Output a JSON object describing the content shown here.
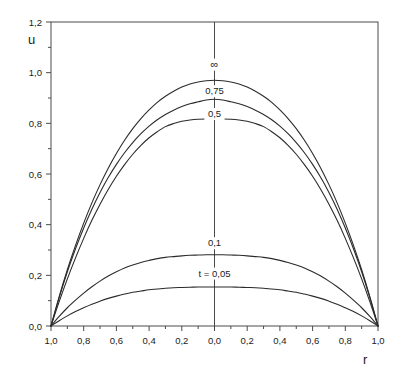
{
  "figure": {
    "axis_label_y": "u",
    "axis_label_x": "r",
    "background": "#ffffff",
    "line_color": "#2b2b2b",
    "axis_color": "#4a4a4a"
  },
  "chart_data": {
    "type": "line",
    "title": "",
    "subtitle": "",
    "xlabel": "r",
    "ylabel": "u",
    "xlim": [
      -1.0,
      1.0
    ],
    "ylim": [
      0.0,
      1.2
    ],
    "grid": false,
    "legend": "inline-curve-labels",
    "x_tick_labels": [
      "1,0",
      "0,8",
      "0,6",
      "0,4",
      "0,2",
      "0,0",
      "0,2",
      "0,4",
      "0,6",
      "0,8",
      "1,0"
    ],
    "x_tick_values": [
      -1.0,
      -0.8,
      -0.6,
      -0.4,
      -0.2,
      0.0,
      0.2,
      0.4,
      0.6,
      0.8,
      1.0
    ],
    "y_tick_labels": [
      "0,0",
      "0,2",
      "0,4",
      "0,6",
      "0,8",
      "1,0",
      "1,2"
    ],
    "y_tick_values": [
      0.0,
      0.2,
      0.4,
      0.6,
      0.8,
      1.0,
      1.2
    ],
    "y_minor_tick_values": [
      0.1,
      0.3,
      0.5,
      0.7,
      0.9,
      1.1
    ],
    "x_minor_tick_values": [
      -0.9,
      -0.7,
      -0.5,
      -0.3,
      -0.1,
      0.1,
      0.3,
      0.5,
      0.7,
      0.9
    ],
    "annotations": [
      {
        "text": "∞",
        "x": 0.0,
        "y": 1.02
      },
      {
        "text": "0,75",
        "x": 0.0,
        "y": 0.915
      },
      {
        "text": "0,5",
        "x": 0.0,
        "y": 0.825
      },
      {
        "text": "0,1",
        "x": 0.0,
        "y": 0.315
      },
      {
        "text": "t = 0,05",
        "x": 0.0,
        "y": 0.195
      }
    ],
    "series": [
      {
        "name": "∞",
        "label": "∞",
        "t": "inf",
        "peak_value": 0.97,
        "x": [
          -1.0,
          -0.95,
          -0.9,
          -0.85,
          -0.8,
          -0.75,
          -0.7,
          -0.65,
          -0.6,
          -0.55,
          -0.5,
          -0.45,
          -0.4,
          -0.35,
          -0.3,
          -0.25,
          -0.2,
          -0.15,
          -0.1,
          -0.05,
          0.0,
          0.05,
          0.1,
          0.15,
          0.2,
          0.25,
          0.3,
          0.35,
          0.4,
          0.45,
          0.5,
          0.55,
          0.6,
          0.65,
          0.7,
          0.75,
          0.8,
          0.85,
          0.9,
          0.95,
          1.0
        ],
        "values": [
          0.0,
          0.116,
          0.222,
          0.318,
          0.406,
          0.486,
          0.558,
          0.623,
          0.681,
          0.733,
          0.779,
          0.819,
          0.853,
          0.883,
          0.907,
          0.927,
          0.943,
          0.955,
          0.963,
          0.968,
          0.97,
          0.968,
          0.963,
          0.955,
          0.943,
          0.927,
          0.907,
          0.883,
          0.853,
          0.819,
          0.779,
          0.733,
          0.681,
          0.623,
          0.558,
          0.486,
          0.406,
          0.318,
          0.222,
          0.116,
          0.0
        ]
      },
      {
        "name": "0,75",
        "label": "0,75",
        "t": 0.75,
        "peak_value": 0.895,
        "x": [
          -1.0,
          -0.95,
          -0.9,
          -0.85,
          -0.8,
          -0.75,
          -0.7,
          -0.65,
          -0.6,
          -0.55,
          -0.5,
          -0.45,
          -0.4,
          -0.35,
          -0.3,
          -0.25,
          -0.2,
          -0.15,
          -0.1,
          -0.05,
          0.0,
          0.05,
          0.1,
          0.15,
          0.2,
          0.25,
          0.3,
          0.35,
          0.4,
          0.45,
          0.5,
          0.55,
          0.6,
          0.65,
          0.7,
          0.75,
          0.8,
          0.85,
          0.9,
          0.95,
          1.0
        ],
        "values": [
          0.0,
          0.112,
          0.214,
          0.305,
          0.387,
          0.461,
          0.527,
          0.586,
          0.638,
          0.684,
          0.724,
          0.759,
          0.789,
          0.814,
          0.835,
          0.852,
          0.866,
          0.877,
          0.885,
          0.892,
          0.895,
          0.892,
          0.885,
          0.877,
          0.866,
          0.852,
          0.835,
          0.814,
          0.789,
          0.759,
          0.724,
          0.684,
          0.638,
          0.586,
          0.527,
          0.461,
          0.387,
          0.305,
          0.214,
          0.112,
          0.0
        ]
      },
      {
        "name": "0,5",
        "label": "0,5",
        "t": 0.5,
        "peak_value": 0.817,
        "x": [
          -1.0,
          -0.95,
          -0.9,
          -0.85,
          -0.8,
          -0.75,
          -0.7,
          -0.65,
          -0.6,
          -0.55,
          -0.5,
          -0.45,
          -0.4,
          -0.35,
          -0.3,
          -0.25,
          -0.2,
          -0.15,
          -0.1,
          -0.05,
          0.0,
          0.05,
          0.1,
          0.15,
          0.2,
          0.25,
          0.3,
          0.35,
          0.4,
          0.45,
          0.5,
          0.55,
          0.6,
          0.65,
          0.7,
          0.75,
          0.8,
          0.85,
          0.9,
          0.95,
          1.0
        ],
        "values": [
          0.0,
          0.096,
          0.186,
          0.269,
          0.346,
          0.417,
          0.481,
          0.539,
          0.591,
          0.637,
          0.678,
          0.713,
          0.743,
          0.767,
          0.787,
          0.799,
          0.808,
          0.813,
          0.816,
          0.817,
          0.817,
          0.817,
          0.816,
          0.813,
          0.808,
          0.799,
          0.787,
          0.767,
          0.743,
          0.713,
          0.678,
          0.637,
          0.591,
          0.539,
          0.481,
          0.417,
          0.346,
          0.269,
          0.186,
          0.096,
          0.0
        ]
      },
      {
        "name": "0,1",
        "label": "0,1",
        "t": 0.1,
        "peak_value": 0.281,
        "x": [
          -1.0,
          -0.95,
          -0.9,
          -0.85,
          -0.8,
          -0.75,
          -0.7,
          -0.65,
          -0.6,
          -0.55,
          -0.5,
          -0.45,
          -0.4,
          -0.35,
          -0.3,
          -0.25,
          -0.2,
          -0.15,
          -0.1,
          -0.05,
          0.0,
          0.05,
          0.1,
          0.15,
          0.2,
          0.25,
          0.3,
          0.35,
          0.4,
          0.45,
          0.5,
          0.55,
          0.6,
          0.65,
          0.7,
          0.75,
          0.8,
          0.85,
          0.9,
          0.95,
          1.0
        ],
        "values": [
          0.0,
          0.038,
          0.072,
          0.102,
          0.13,
          0.155,
          0.177,
          0.197,
          0.214,
          0.229,
          0.241,
          0.251,
          0.259,
          0.266,
          0.271,
          0.274,
          0.277,
          0.279,
          0.28,
          0.281,
          0.281,
          0.281,
          0.28,
          0.279,
          0.277,
          0.274,
          0.271,
          0.266,
          0.259,
          0.251,
          0.241,
          0.229,
          0.214,
          0.197,
          0.177,
          0.155,
          0.13,
          0.102,
          0.072,
          0.038,
          0.0
        ]
      },
      {
        "name": "t = 0,05",
        "label": "t = 0,05",
        "t": 0.05,
        "peak_value": 0.154,
        "x": [
          -1.0,
          -0.95,
          -0.9,
          -0.85,
          -0.8,
          -0.75,
          -0.7,
          -0.65,
          -0.6,
          -0.55,
          -0.5,
          -0.45,
          -0.4,
          -0.35,
          -0.3,
          -0.25,
          -0.2,
          -0.15,
          -0.1,
          -0.05,
          0.0,
          0.05,
          0.1,
          0.15,
          0.2,
          0.25,
          0.3,
          0.35,
          0.4,
          0.45,
          0.5,
          0.55,
          0.6,
          0.65,
          0.7,
          0.75,
          0.8,
          0.85,
          0.9,
          0.95,
          1.0
        ],
        "values": [
          0.0,
          0.021,
          0.04,
          0.057,
          0.072,
          0.086,
          0.098,
          0.109,
          0.118,
          0.126,
          0.133,
          0.138,
          0.143,
          0.146,
          0.149,
          0.151,
          0.152,
          0.153,
          0.154,
          0.154,
          0.154,
          0.154,
          0.154,
          0.153,
          0.152,
          0.151,
          0.149,
          0.146,
          0.143,
          0.138,
          0.133,
          0.126,
          0.118,
          0.109,
          0.098,
          0.086,
          0.072,
          0.057,
          0.04,
          0.021,
          0.0
        ]
      }
    ]
  }
}
